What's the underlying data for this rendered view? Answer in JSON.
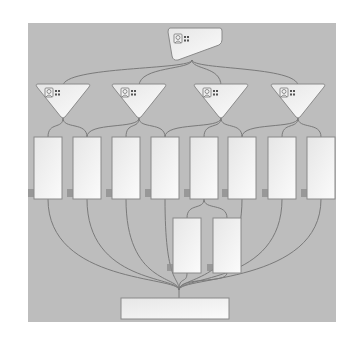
{
  "diagram": {
    "type": "hierarchy-flow",
    "colors": {
      "page_bg": "#ffffff",
      "canvas_bg": "#bdbdbd",
      "node_fill": "#f4f4f4",
      "node_stroke": "#8a8a8a",
      "edge": "#7a7a7a",
      "shadow": "#8e8e8e"
    },
    "root": {
      "id": "root",
      "shape": "tag",
      "icon": "person-card-icon",
      "x": 168,
      "y": 28,
      "w": 54,
      "h": 32
    },
    "managers": [
      {
        "id": "m1",
        "shape": "down-triangle",
        "icon": "person-card-icon",
        "cx": 63,
        "y": 84
      },
      {
        "id": "m2",
        "shape": "down-triangle",
        "icon": "person-card-icon",
        "cx": 139,
        "y": 84
      },
      {
        "id": "m3",
        "shape": "down-triangle",
        "icon": "person-card-icon",
        "cx": 221,
        "y": 84
      },
      {
        "id": "m4",
        "shape": "down-triangle",
        "icon": "person-card-icon",
        "cx": 298,
        "y": 84
      }
    ],
    "row1": [
      {
        "id": "r1",
        "x": 34
      },
      {
        "id": "r2",
        "x": 73
      },
      {
        "id": "r3",
        "x": 112
      },
      {
        "id": "r4",
        "x": 151
      },
      {
        "id": "r5",
        "x": 190
      },
      {
        "id": "r6",
        "x": 228
      },
      {
        "id": "r7",
        "x": 268
      },
      {
        "id": "r8",
        "x": 307
      }
    ],
    "row1_geom": {
      "y": 137,
      "w": 28,
      "h": 62
    },
    "row2": [
      {
        "id": "s1",
        "x": 173
      },
      {
        "id": "s2",
        "x": 213
      }
    ],
    "row2_geom": {
      "y": 218,
      "w": 28,
      "h": 55
    },
    "sink": {
      "id": "sink",
      "x": 121,
      "y": 298,
      "w": 108,
      "h": 21
    },
    "edges": [
      {
        "from": "root",
        "to": [
          "m1",
          "m2",
          "m3",
          "m4"
        ]
      },
      {
        "from": "m1",
        "to": [
          "r1",
          "r2"
        ]
      },
      {
        "from": "m2",
        "to": [
          "r2",
          "r3",
          "r4"
        ]
      },
      {
        "from": "m3",
        "to": [
          "r4",
          "r5",
          "r6"
        ]
      },
      {
        "from": "m4",
        "to": [
          "r6",
          "r7",
          "r8"
        ]
      },
      {
        "from": "r5",
        "to": [
          "s1",
          "s2"
        ]
      },
      {
        "from": [
          "r1",
          "r2",
          "r3",
          "r4",
          "r6",
          "r7",
          "r8",
          "s1",
          "s2"
        ],
        "to": "sink"
      }
    ]
  }
}
